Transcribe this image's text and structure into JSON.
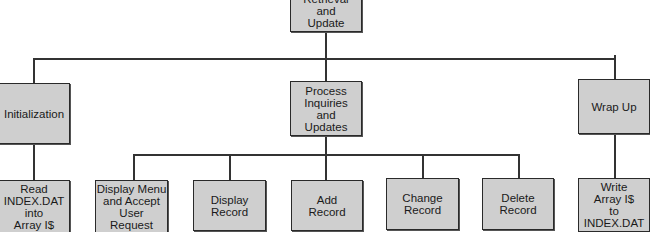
{
  "diagram": {
    "type": "hierarchy-chart",
    "root": {
      "label": "Retrieval\nand\nUpdate"
    },
    "level1": [
      {
        "label": "Initialization"
      },
      {
        "label": "Process\nInquiries\nand\nUpdates"
      },
      {
        "label": "Wrap Up"
      }
    ],
    "level2": {
      "initialization_children": [
        {
          "label": "Read\nINDEX.DAT\ninto\nArray I$"
        }
      ],
      "process_children": [
        {
          "label": "Display Menu\nand Accept\nUser\nRequest"
        },
        {
          "label": "Display\nRecord"
        },
        {
          "label": "Add\nRecord"
        },
        {
          "label": "Change\nRecord"
        },
        {
          "label": "Delete\nRecord"
        }
      ],
      "wrapup_children": [
        {
          "label": "Write\nArray I$\nto\nINDEX.DAT"
        }
      ]
    },
    "colors": {
      "box_fill": "#cfcfcf",
      "box_border": "#2a2a2a",
      "connector": "#333333",
      "background": "#ffffff"
    }
  }
}
